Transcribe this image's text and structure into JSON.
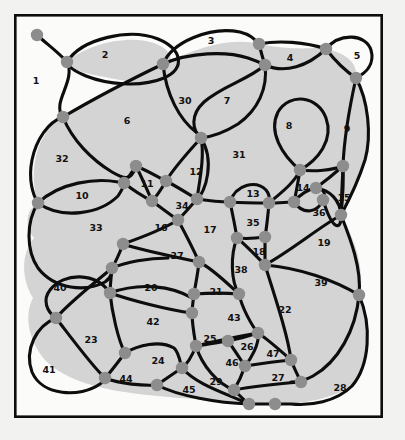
{
  "figure": {
    "type": "planar-graph-face-diagram",
    "canvas": {
      "width": 405,
      "height": 440
    },
    "frame": {
      "x": 14,
      "y": 14,
      "width": 369,
      "height": 404
    },
    "colors": {
      "background": "#f2f2f0",
      "frame_fill": "#fbfbfa",
      "frame_stroke": "#0d0d0d",
      "region_fill": "#d4d4d4",
      "curve_stroke": "#0d0d0d",
      "node_fill": "#8d8d8d",
      "label_color": "#111111"
    },
    "counts": {
      "faces": 47,
      "vertices": 49
    }
  },
  "face_labels": [
    {
      "id": 1,
      "text": "1",
      "x": 36,
      "y": 81
    },
    {
      "id": 2,
      "text": "2",
      "x": 105,
      "y": 55
    },
    {
      "id": 3,
      "text": "3",
      "x": 211,
      "y": 41
    },
    {
      "id": 4,
      "text": "4",
      "x": 290,
      "y": 58
    },
    {
      "id": 5,
      "text": "5",
      "x": 357,
      "y": 56
    },
    {
      "id": 6,
      "text": "6",
      "x": 127,
      "y": 121
    },
    {
      "id": 7,
      "text": "7",
      "x": 227,
      "y": 101
    },
    {
      "id": 8,
      "text": "8",
      "x": 289,
      "y": 126
    },
    {
      "id": 9,
      "text": "9",
      "x": 347,
      "y": 129
    },
    {
      "id": 10,
      "text": "10",
      "x": 82,
      "y": 196
    },
    {
      "id": 11,
      "text": "11",
      "x": 147,
      "y": 184
    },
    {
      "id": 12,
      "text": "12",
      "x": 196,
      "y": 172
    },
    {
      "id": 13,
      "text": "13",
      "x": 253,
      "y": 194
    },
    {
      "id": 14,
      "text": "14",
      "x": 303,
      "y": 188
    },
    {
      "id": 15,
      "text": "15",
      "x": 344,
      "y": 198
    },
    {
      "id": 16,
      "text": "16",
      "x": 161,
      "y": 228
    },
    {
      "id": 17,
      "text": "17",
      "x": 210,
      "y": 230
    },
    {
      "id": 18,
      "text": "18",
      "x": 259,
      "y": 252
    },
    {
      "id": 19,
      "text": "19",
      "x": 324,
      "y": 243
    },
    {
      "id": 20,
      "text": "20",
      "x": 151,
      "y": 288
    },
    {
      "id": 21,
      "text": "21",
      "x": 216,
      "y": 292
    },
    {
      "id": 22,
      "text": "22",
      "x": 285,
      "y": 310
    },
    {
      "id": 23,
      "text": "23",
      "x": 91,
      "y": 340
    },
    {
      "id": 24,
      "text": "24",
      "x": 158,
      "y": 361
    },
    {
      "id": 25,
      "text": "25",
      "x": 210,
      "y": 339
    },
    {
      "id": 26,
      "text": "26",
      "x": 247,
      "y": 347
    },
    {
      "id": 27,
      "text": "27",
      "x": 278,
      "y": 378
    },
    {
      "id": 28,
      "text": "28",
      "x": 340,
      "y": 388
    },
    {
      "id": 29,
      "text": "29",
      "x": 216,
      "y": 382
    },
    {
      "id": 30,
      "text": "30",
      "x": 185,
      "y": 101
    },
    {
      "id": 31,
      "text": "31",
      "x": 239,
      "y": 155
    },
    {
      "id": 32,
      "text": "32",
      "x": 62,
      "y": 159
    },
    {
      "id": 33,
      "text": "33",
      "x": 96,
      "y": 228
    },
    {
      "id": 34,
      "text": "34",
      "x": 182,
      "y": 206
    },
    {
      "id": 35,
      "text": "35",
      "x": 253,
      "y": 223
    },
    {
      "id": 36,
      "text": "36",
      "x": 319,
      "y": 213
    },
    {
      "id": 37,
      "text": "37",
      "x": 177,
      "y": 256
    },
    {
      "id": 38,
      "text": "38",
      "x": 241,
      "y": 270
    },
    {
      "id": 39,
      "text": "39",
      "x": 321,
      "y": 283
    },
    {
      "id": 40,
      "text": "40",
      "x": 60,
      "y": 288
    },
    {
      "id": 41,
      "text": "41",
      "x": 49,
      "y": 370
    },
    {
      "id": 42,
      "text": "42",
      "x": 153,
      "y": 322
    },
    {
      "id": 43,
      "text": "43",
      "x": 234,
      "y": 318
    },
    {
      "id": 44,
      "text": "44",
      "x": 126,
      "y": 379
    },
    {
      "id": 45,
      "text": "45",
      "x": 189,
      "y": 390
    },
    {
      "id": 46,
      "text": "46",
      "x": 232,
      "y": 363
    },
    {
      "id": 47,
      "text": "47",
      "x": 273,
      "y": 354
    }
  ],
  "vertices": [
    {
      "id": "v1",
      "x": 37,
      "y": 35,
      "r": 6.2
    },
    {
      "id": "v2",
      "x": 67,
      "y": 62,
      "r": 6.2
    },
    {
      "id": "v3",
      "x": 63,
      "y": 117,
      "r": 6.2
    },
    {
      "id": "v4",
      "x": 163,
      "y": 64,
      "r": 6.2
    },
    {
      "id": "v5",
      "x": 259,
      "y": 44,
      "r": 6.2
    },
    {
      "id": "v6",
      "x": 265,
      "y": 65,
      "r": 6.2
    },
    {
      "id": "v7",
      "x": 326,
      "y": 49,
      "r": 6.2
    },
    {
      "id": "v8",
      "x": 356,
      "y": 78,
      "r": 6.2
    },
    {
      "id": "v9",
      "x": 201,
      "y": 138,
      "r": 6.2
    },
    {
      "id": "v10",
      "x": 300,
      "y": 170,
      "r": 6.2
    },
    {
      "id": "v11",
      "x": 343,
      "y": 166,
      "r": 6.2
    },
    {
      "id": "v12",
      "x": 136,
      "y": 166,
      "r": 6.2
    },
    {
      "id": "v13",
      "x": 124,
      "y": 183,
      "r": 6.2
    },
    {
      "id": "v14",
      "x": 166,
      "y": 181,
      "r": 6.2
    },
    {
      "id": "v15",
      "x": 152,
      "y": 201,
      "r": 6.2
    },
    {
      "id": "v16",
      "x": 38,
      "y": 203,
      "r": 6.2
    },
    {
      "id": "v17",
      "x": 197,
      "y": 199,
      "r": 6.2
    },
    {
      "id": "v18",
      "x": 230,
      "y": 202,
      "r": 6.2
    },
    {
      "id": "v19",
      "x": 269,
      "y": 203,
      "r": 6.2
    },
    {
      "id": "v20",
      "x": 294,
      "y": 202,
      "r": 6.2
    },
    {
      "id": "v21",
      "x": 316,
      "y": 188,
      "r": 6.2
    },
    {
      "id": "v22",
      "x": 341,
      "y": 215,
      "r": 6.2
    },
    {
      "id": "v23",
      "x": 178,
      "y": 220,
      "r": 6.2
    },
    {
      "id": "v24",
      "x": 265,
      "y": 237,
      "r": 6.2
    },
    {
      "id": "v25",
      "x": 123,
      "y": 244,
      "r": 6.2
    },
    {
      "id": "v26",
      "x": 112,
      "y": 268,
      "r": 6.2
    },
    {
      "id": "v27",
      "x": 199,
      "y": 262,
      "r": 6.2
    },
    {
      "id": "v28",
      "x": 237,
      "y": 238,
      "r": 6.2
    },
    {
      "id": "v29",
      "x": 265,
      "y": 265,
      "r": 6.2
    },
    {
      "id": "v30",
      "x": 110,
      "y": 293,
      "r": 6.2
    },
    {
      "id": "v31",
      "x": 194,
      "y": 294,
      "r": 6.2
    },
    {
      "id": "v32",
      "x": 239,
      "y": 294,
      "r": 6.2
    },
    {
      "id": "v33",
      "x": 56,
      "y": 318,
      "r": 6.2
    },
    {
      "id": "v34",
      "x": 192,
      "y": 313,
      "r": 6.2
    },
    {
      "id": "v35",
      "x": 359,
      "y": 295,
      "r": 6.2
    },
    {
      "id": "v36",
      "x": 258,
      "y": 333,
      "r": 6.2
    },
    {
      "id": "v37",
      "x": 228,
      "y": 341,
      "r": 6.2
    },
    {
      "id": "v38",
      "x": 196,
      "y": 346,
      "r": 6.2
    },
    {
      "id": "v39",
      "x": 125,
      "y": 353,
      "r": 6.2
    },
    {
      "id": "v40",
      "x": 291,
      "y": 360,
      "r": 6.2
    },
    {
      "id": "v41",
      "x": 245,
      "y": 366,
      "r": 6.2
    },
    {
      "id": "v42",
      "x": 182,
      "y": 368,
      "r": 6.2
    },
    {
      "id": "v43",
      "x": 105,
      "y": 378,
      "r": 6.2
    },
    {
      "id": "v44",
      "x": 157,
      "y": 385,
      "r": 6.2
    },
    {
      "id": "v45",
      "x": 234,
      "y": 390,
      "r": 6.2
    },
    {
      "id": "v46",
      "x": 301,
      "y": 382,
      "r": 6.2
    },
    {
      "id": "v47",
      "x": 249,
      "y": 404,
      "r": 6.2
    },
    {
      "id": "v48",
      "x": 275,
      "y": 404,
      "r": 6.2
    },
    {
      "id": "v49",
      "x": 323,
      "y": 200,
      "r": 6.2
    }
  ]
}
